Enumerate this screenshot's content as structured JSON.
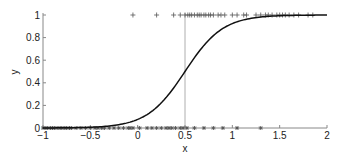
{
  "chart_data": {
    "type": "line",
    "title": "",
    "xlabel": "x",
    "ylabel": "y",
    "xlim": [
      -1,
      2
    ],
    "ylim": [
      0,
      1
    ],
    "grid": false,
    "legend": null,
    "xticks": [
      -1,
      -0.5,
      0,
      0.5,
      1,
      1.5,
      2
    ],
    "xtick_labels": [
      "−1",
      "−0.5",
      "0",
      "0.5",
      "1",
      "1.5",
      "2"
    ],
    "yticks": [
      0,
      0.2,
      0.4,
      0.6,
      0.8,
      1
    ],
    "ytick_labels": [
      "0",
      "0.2",
      "0.4",
      "0.6",
      "0.8",
      "1"
    ],
    "annotations": [
      {
        "type": "vline",
        "x": 0.5,
        "color": "#999999"
      }
    ],
    "series": [
      {
        "name": "logistic fit",
        "kind": "line",
        "color": "#111111",
        "function": "1/(1+exp(-5*(x-0.5)))",
        "x": [
          -1,
          -0.75,
          -0.5,
          -0.25,
          0,
          0.25,
          0.5,
          0.75,
          1,
          1.25,
          1.5,
          1.75,
          2
        ],
        "y": [
          0.001,
          0.002,
          0.007,
          0.023,
          0.076,
          0.223,
          0.5,
          0.777,
          0.924,
          0.977,
          0.993,
          0.998,
          0.999
        ]
      },
      {
        "name": "y=1 samples",
        "kind": "scatter",
        "marker": "+",
        "color": "#555555",
        "y_value": 1,
        "x": [
          -0.05,
          0.2,
          0.38,
          0.45,
          0.5,
          0.53,
          0.55,
          0.57,
          0.6,
          0.63,
          0.65,
          0.67,
          0.7,
          0.72,
          0.75,
          0.77,
          0.8,
          0.85,
          0.88,
          0.92,
          1.0,
          1.05,
          1.12,
          1.15,
          1.25,
          1.3,
          1.35,
          1.38,
          1.42,
          1.47,
          1.5,
          1.53,
          1.56,
          1.6,
          1.65,
          1.7,
          1.8,
          1.85
        ]
      },
      {
        "name": "y=0 samples",
        "kind": "scatter",
        "marker": "*",
        "color": "#555555",
        "y_value": 0,
        "x": [
          -1,
          -0.97,
          -0.95,
          -0.92,
          -0.9,
          -0.88,
          -0.85,
          -0.82,
          -0.8,
          -0.77,
          -0.75,
          -0.72,
          -0.7,
          -0.65,
          -0.6,
          -0.55,
          -0.5,
          -0.45,
          -0.42,
          -0.38,
          -0.35,
          -0.3,
          -0.25,
          -0.2,
          -0.15,
          -0.1,
          -0.08,
          -0.05,
          0.02,
          0.1,
          0.15,
          0.2,
          0.25,
          0.3,
          0.33,
          0.36,
          0.4,
          0.45,
          0.48,
          0.52,
          0.6,
          0.7,
          0.8,
          0.9,
          1.05,
          1.3
        ]
      }
    ]
  }
}
